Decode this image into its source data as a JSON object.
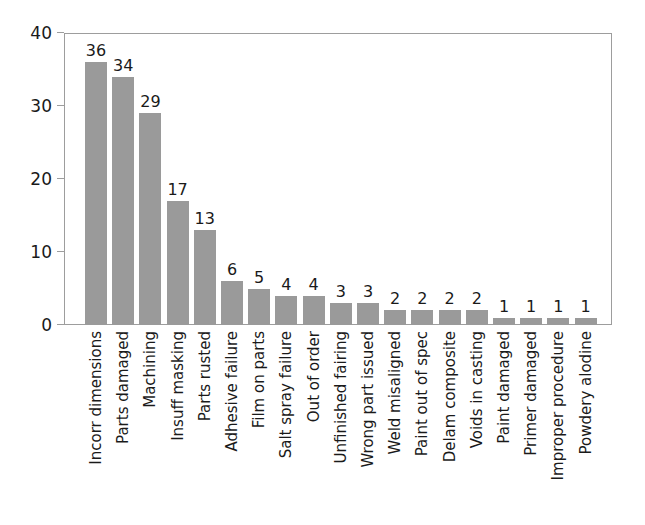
{
  "chart_data": {
    "type": "bar",
    "title": "",
    "subtitle": "",
    "xlabel": "",
    "ylabel": "",
    "ylim": [
      0,
      40
    ],
    "yticks": [
      0,
      10,
      20,
      30,
      40
    ],
    "grid": false,
    "legend": null,
    "bar_color": "#9a9a9a",
    "axis_color": "#9d9d9d",
    "background_color": "#ffffff",
    "label_rotation": 90,
    "show_value_labels": true,
    "categories": [
      "Incorr dimensions",
      "Parts damaged",
      "Machining",
      "Insuff masking",
      "Parts rusted",
      "Adhesive failure",
      "Film on parts",
      "Salt spray failure",
      "Out of order",
      "Unfinished fairing",
      "Wrong part issued",
      "Weld misaligned",
      "Paint out of spec",
      "Delam composite",
      "Voids in casting",
      "Paint damaged",
      "Primer damaged",
      "Improper procedure",
      "Powdery alodine"
    ],
    "values": [
      36,
      34,
      29,
      17,
      13,
      6,
      5,
      4,
      4,
      3,
      3,
      2,
      2,
      2,
      2,
      1,
      1,
      1,
      1
    ]
  }
}
